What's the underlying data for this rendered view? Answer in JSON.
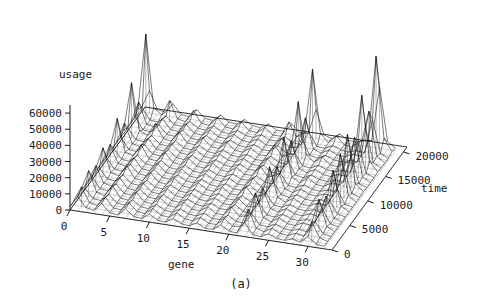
{
  "figure": {
    "caption": "(a)",
    "background": "#ffffff",
    "line_color": "#111111"
  },
  "chart_data": {
    "type": "line",
    "subtype": "3d-wireframe-surface",
    "title": "",
    "xlabel": "gene",
    "ylabel": "time",
    "zlabel": "usage",
    "xlim": [
      0,
      33
    ],
    "ylim": [
      0,
      21000
    ],
    "zlim": [
      0,
      65000
    ],
    "grid": false,
    "legend": "none",
    "xticks": [
      0,
      5,
      10,
      15,
      20,
      25,
      30
    ],
    "xticklabels": [
      "0",
      "5",
      "10",
      "15",
      "20",
      "25",
      "30"
    ],
    "yticks": [
      0,
      5000,
      10000,
      15000,
      20000
    ],
    "yticklabels": [
      "0",
      "5000",
      "10000",
      "15000",
      "20000"
    ],
    "zticks": [
      0,
      10000,
      20000,
      30000,
      40000,
      50000,
      60000
    ],
    "zticklabels": [
      "0",
      "10000",
      "20000",
      "30000",
      "40000",
      "50000",
      "60000"
    ],
    "x": [
      0,
      1,
      2,
      3,
      4,
      5,
      6,
      7,
      8,
      9,
      10,
      11,
      12,
      13,
      14,
      15,
      16,
      17,
      18,
      19,
      20,
      21,
      22,
      23,
      24,
      25,
      26,
      27,
      28,
      29,
      30,
      31,
      32
    ],
    "y": [
      0,
      1000,
      2000,
      3000,
      4000,
      5000,
      6000,
      7000,
      8000,
      9000,
      10000,
      11000,
      12000,
      13000,
      14000,
      15000,
      16000,
      17000,
      18000,
      19000,
      20000
    ],
    "series": [
      {
        "name": "time=0",
        "values": [
          2000,
          9000,
          3000,
          2000,
          7000,
          2000,
          1500,
          6000,
          2000,
          1500,
          5000,
          2000,
          1500,
          4500,
          2000,
          1500,
          4000,
          1500,
          1500,
          5000,
          2000,
          1500,
          9000,
          2000,
          1500,
          4000,
          2000,
          1500,
          3000,
          2000,
          6000,
          2000,
          1500
        ]
      },
      {
        "name": "time=1000",
        "values": [
          2500,
          12000,
          3000,
          2000,
          8000,
          2000,
          1500,
          6500,
          2000,
          1500,
          5500,
          2000,
          1500,
          5000,
          2000,
          1500,
          4500,
          1500,
          1500,
          6000,
          2000,
          2500,
          14000,
          3000,
          1500,
          4500,
          2000,
          1500,
          3500,
          2500,
          12000,
          3000,
          1500
        ]
      },
      {
        "name": "time=2000",
        "values": [
          2000,
          8000,
          2500,
          2000,
          6500,
          2000,
          1500,
          5500,
          2000,
          1500,
          5000,
          2000,
          1500,
          4500,
          2000,
          1500,
          4000,
          1500,
          1500,
          5000,
          2000,
          1500,
          8000,
          2000,
          1500,
          4000,
          2000,
          1500,
          3000,
          2000,
          9000,
          2500,
          1500
        ]
      },
      {
        "name": "time=3000",
        "values": [
          3000,
          16000,
          3500,
          2000,
          9000,
          2000,
          1500,
          7000,
          2000,
          1500,
          6000,
          2000,
          1500,
          5500,
          2000,
          1500,
          5000,
          1500,
          1500,
          7000,
          2000,
          3000,
          18000,
          3500,
          1500,
          5000,
          2000,
          1500,
          4000,
          3000,
          20000,
          4000,
          1500
        ]
      },
      {
        "name": "time=4000",
        "values": [
          2000,
          9000,
          2500,
          2000,
          7000,
          2000,
          1500,
          6000,
          2000,
          1500,
          5000,
          2000,
          1500,
          4500,
          2000,
          1500,
          4000,
          1500,
          1500,
          5500,
          2000,
          1500,
          9000,
          2000,
          1500,
          4000,
          2000,
          1500,
          3000,
          2000,
          11000,
          2500,
          1500
        ]
      },
      {
        "name": "time=5000",
        "values": [
          2500,
          13000,
          3000,
          2000,
          8000,
          2000,
          1500,
          6500,
          2000,
          1500,
          5500,
          2000,
          1500,
          5000,
          2000,
          1500,
          4500,
          1500,
          1500,
          6000,
          2000,
          2500,
          15000,
          3000,
          1500,
          4500,
          2000,
          1500,
          3500,
          2500,
          16000,
          3000,
          1500
        ]
      },
      {
        "name": "time=6000",
        "values": [
          2000,
          8500,
          2500,
          2000,
          6500,
          2000,
          1500,
          5500,
          2000,
          1500,
          5000,
          2000,
          1500,
          4500,
          2000,
          1500,
          4000,
          1500,
          1500,
          5000,
          2000,
          1500,
          8500,
          2000,
          1500,
          4000,
          2000,
          1500,
          3000,
          2000,
          10000,
          2500,
          1500
        ]
      },
      {
        "name": "time=7000",
        "values": [
          3000,
          18000,
          3500,
          2000,
          9500,
          2000,
          1500,
          7000,
          2000,
          1500,
          6000,
          2000,
          1500,
          5500,
          2000,
          1500,
          5000,
          1500,
          1500,
          7500,
          2000,
          3500,
          22000,
          4000,
          1500,
          5000,
          2000,
          1500,
          4000,
          3500,
          26000,
          4500,
          1500
        ]
      },
      {
        "name": "time=8000",
        "values": [
          2000,
          9000,
          2500,
          2000,
          7000,
          2000,
          1500,
          6000,
          2000,
          1500,
          5000,
          2000,
          1500,
          4500,
          2000,
          1500,
          4000,
          1500,
          1500,
          5500,
          2000,
          1500,
          10000,
          2500,
          1500,
          4000,
          2000,
          1500,
          3000,
          2000,
          12000,
          2500,
          1500
        ]
      },
      {
        "name": "time=9000",
        "values": [
          2500,
          14000,
          3000,
          2000,
          8000,
          2000,
          1500,
          6500,
          2000,
          1500,
          5500,
          2000,
          1500,
          5000,
          2000,
          1500,
          4500,
          1500,
          1500,
          6500,
          2000,
          2500,
          16000,
          3000,
          1500,
          4500,
          2000,
          1500,
          3500,
          3000,
          30000,
          5000,
          1500
        ]
      },
      {
        "name": "time=10000",
        "values": [
          2000,
          8500,
          2500,
          2000,
          6500,
          2000,
          1500,
          5500,
          2000,
          1500,
          5000,
          2000,
          1500,
          4500,
          2000,
          1500,
          4000,
          1500,
          1500,
          5000,
          2000,
          1500,
          9000,
          2000,
          1500,
          4000,
          2000,
          1500,
          3000,
          2500,
          18000,
          3000,
          1500
        ]
      },
      {
        "name": "time=11000",
        "values": [
          3500,
          24000,
          4000,
          2500,
          10000,
          2000,
          1500,
          7500,
          2000,
          1500,
          6000,
          2000,
          1500,
          5500,
          2000,
          1500,
          5000,
          1500,
          1500,
          8000,
          2000,
          4000,
          28000,
          4500,
          1500,
          5500,
          2000,
          1500,
          4500,
          4000,
          36000,
          6000,
          2000
        ]
      },
      {
        "name": "time=12000",
        "values": [
          2000,
          9500,
          2500,
          2000,
          7000,
          2000,
          1500,
          6000,
          2000,
          1500,
          5000,
          2000,
          1500,
          4500,
          2000,
          1500,
          4000,
          1500,
          1500,
          5500,
          2000,
          1500,
          11000,
          2500,
          1500,
          4000,
          2000,
          1500,
          3000,
          2500,
          20000,
          3000,
          1500
        ]
      },
      {
        "name": "time=13000",
        "values": [
          2500,
          15000,
          3000,
          2000,
          8000,
          2000,
          1500,
          6500,
          2000,
          1500,
          5500,
          2000,
          1500,
          5000,
          2000,
          1500,
          4500,
          1500,
          1500,
          6500,
          2000,
          3000,
          20000,
          3500,
          1500,
          4500,
          2000,
          1500,
          3500,
          3000,
          28000,
          4500,
          1500
        ]
      },
      {
        "name": "time=14000",
        "values": [
          2000,
          9000,
          2500,
          2000,
          6500,
          2000,
          1500,
          5500,
          2000,
          1500,
          5000,
          2000,
          1500,
          4500,
          2000,
          1500,
          4000,
          1500,
          1500,
          5000,
          2000,
          1500,
          9500,
          2000,
          1500,
          4000,
          2000,
          1500,
          3000,
          2500,
          22000,
          3500,
          1500
        ]
      },
      {
        "name": "time=15000",
        "values": [
          4000,
          34000,
          5000,
          3000,
          11000,
          2500,
          1500,
          8000,
          2000,
          1500,
          6500,
          2000,
          1500,
          6000,
          2000,
          1500,
          5000,
          1500,
          1500,
          9000,
          2500,
          5000,
          38000,
          6000,
          2000,
          6000,
          2000,
          1500,
          5000,
          5000,
          48000,
          8000,
          2000
        ]
      },
      {
        "name": "time=16000",
        "values": [
          2000,
          10000,
          2500,
          2000,
          7000,
          2000,
          1500,
          6000,
          2000,
          1500,
          5000,
          2000,
          1500,
          4500,
          2000,
          1500,
          4000,
          1500,
          1500,
          5500,
          2000,
          1500,
          12000,
          2500,
          1500,
          4000,
          2000,
          1500,
          3000,
          3000,
          26000,
          4000,
          1500
        ]
      },
      {
        "name": "time=17000",
        "values": [
          2500,
          16000,
          3000,
          2000,
          8000,
          2000,
          1500,
          6500,
          2000,
          1500,
          5500,
          2000,
          1500,
          5000,
          2000,
          1500,
          4500,
          1500,
          1500,
          7000,
          2000,
          3000,
          22000,
          3500,
          1500,
          4500,
          2000,
          1500,
          4000,
          3500,
          32000,
          5000,
          1500
        ]
      },
      {
        "name": "time=18000",
        "values": [
          2000,
          9000,
          2500,
          2000,
          6500,
          2000,
          1500,
          5500,
          2000,
          1500,
          5000,
          2000,
          1500,
          4500,
          2000,
          1500,
          4000,
          1500,
          1500,
          5000,
          2000,
          1500,
          10000,
          2000,
          1500,
          4000,
          2000,
          1500,
          3000,
          2500,
          24000,
          3500,
          1500
        ]
      },
      {
        "name": "time=19000",
        "values": [
          5000,
          52000,
          7000,
          3500,
          13000,
          2500,
          1500,
          9000,
          2000,
          1500,
          7000,
          2000,
          1500,
          6500,
          2000,
          1500,
          5500,
          1500,
          1500,
          11000,
          2500,
          6000,
          46000,
          7000,
          2000,
          7000,
          2000,
          1500,
          6000,
          7000,
          60000,
          10000,
          2500
        ]
      },
      {
        "name": "time=20000",
        "values": [
          2500,
          14000,
          3000,
          2000,
          8000,
          2000,
          1500,
          6500,
          2000,
          1500,
          5500,
          2000,
          1500,
          5000,
          2000,
          1500,
          4500,
          1500,
          1500,
          6500,
          2000,
          2500,
          18000,
          3000,
          1500,
          5000,
          2000,
          1500,
          3500,
          4000,
          38000,
          5000,
          1500
        ]
      }
    ],
    "spikes_description": "Tall narrow spikes concentrated at gene indices near 1, 22 and 30, strongest at high time values"
  },
  "projection": {
    "origin": {
      "x": 70,
      "y": 210
    },
    "x_axis_vector": {
      "dx": 262,
      "dy": 40
    },
    "y_axis_vector": {
      "dx": 75,
      "dy": -103
    },
    "z_height": 105
  }
}
